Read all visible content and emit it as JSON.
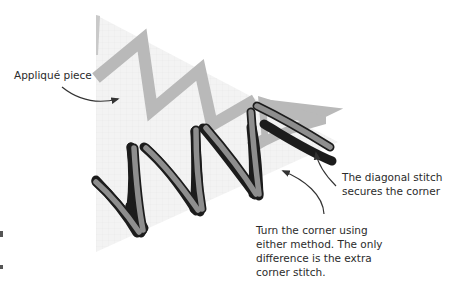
{
  "diagram": {
    "colors": {
      "background": "#ffffff",
      "fabric": "#f1f1f1",
      "fabric_grid": "#e6e6e6",
      "back_stitch": "#b8b8b8",
      "front_stitch_fill": "#8e8e8e",
      "front_stitch_outline": "#1c1c1c",
      "arrow": "#333333",
      "text": "#2b2b2b"
    },
    "labels": {
      "applique_piece": "Appliqué piece",
      "diagonal_stitch": [
        "The diagonal stitch",
        "secures the corner"
      ],
      "turn_corner": [
        "Turn the corner using",
        "either method. The only",
        "difference is the extra",
        "corner stitch."
      ]
    },
    "elements": [
      {
        "name": "applique-fabric",
        "shape": "triangle"
      },
      {
        "name": "background-zigzag-stitch",
        "color": "light gray"
      },
      {
        "name": "foreground-zigzag-stitch",
        "color": "dark gray with black outline"
      },
      {
        "name": "corner-diagonal-stitch"
      }
    ]
  }
}
